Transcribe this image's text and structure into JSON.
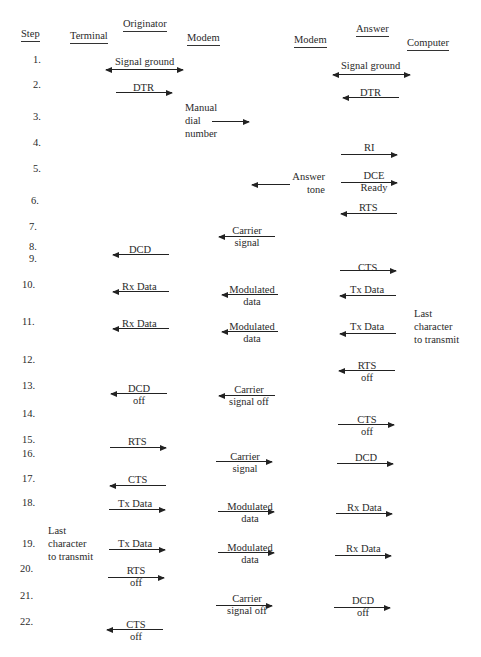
{
  "headers": {
    "step": "Step",
    "terminal": "Terminal",
    "originator": "Originator",
    "orig_modem": "Modem",
    "ans_modem": "Modem",
    "answer": "Answer",
    "computer": "Computer"
  },
  "steps": [
    "1.",
    "2.",
    "3.",
    "4.",
    "5.",
    "6.",
    "7.",
    "8.",
    "9.",
    "10.",
    "11.",
    "12.",
    "13.",
    "14.",
    "15.",
    "16.",
    "17.",
    "18.",
    "19.",
    "20.",
    "21.",
    "22."
  ],
  "labels": {
    "s1_left": "Signal ground",
    "s1_right": "Signal ground",
    "s2_left": "DTR",
    "s2_right": "DTR",
    "s3_manual_1": "Manual",
    "s3_manual_2": "dial",
    "s3_manual_3": "number",
    "s4_ri": "RI",
    "s5_answer_1": "Answer",
    "s5_answer_2": "tone",
    "s5_dce_1": "DCE",
    "s5_dce_2": "Ready",
    "s6_rts": "RTS",
    "s7_carrier_1": "Carrier",
    "s7_carrier_2": "signal",
    "s8_dcd": "DCD",
    "s9_cts": "CTS",
    "s10_rx": "Rx Data",
    "s10_mod_1": "Modulated",
    "s10_mod_2": "data",
    "s10_tx": "Tx Data",
    "s11_rx": "Rx Data",
    "s11_mod_1": "Modulated",
    "s11_mod_2": "data",
    "s11_tx": "Tx Data",
    "s11_last_1": "Last",
    "s11_last_2": "character",
    "s11_last_3": "to transmit",
    "s12_rts_1": "RTS",
    "s12_rts_2": "off",
    "s13_dcd_1": "DCD",
    "s13_dcd_2": "off",
    "s13_carrier_1": "Carrier",
    "s13_carrier_2": "signal off",
    "s14_cts_1": "CTS",
    "s14_cts_2": "off",
    "s15_rts": "RTS",
    "s16_carrier_1": "Carrier",
    "s16_carrier_2": "signal",
    "s16_dcd": "DCD",
    "s17_cts": "CTS",
    "s18_tx": "Tx Data",
    "s18_mod_1": "Modulated",
    "s18_mod_2": "data",
    "s18_rx": "Rx Data",
    "s19_last_1": "Last",
    "s19_last_2": "character",
    "s19_last_3": "to transmit",
    "s19_tx": "Tx Data",
    "s19_mod_1": "Modulated",
    "s19_mod_2": "data",
    "s19_rx": "Rx Data",
    "s20_rts_1": "RTS",
    "s20_rts_2": "off",
    "s21_carrier_1": "Carrier",
    "s21_carrier_2": "signal off",
    "s21_dcd_1": "DCD",
    "s21_dcd_2": "off",
    "s22_cts_1": "CTS",
    "s22_cts_2": "off"
  }
}
